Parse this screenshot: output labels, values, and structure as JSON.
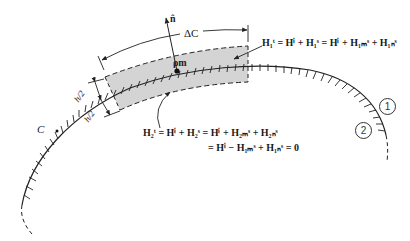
{
  "labels": {
    "normal": "n̂",
    "arc_length": "ΔC",
    "point": "ρm",
    "contour": "C",
    "half_h_top": "h/2",
    "half_h_bottom": "h/2",
    "region_1": "1",
    "region_2": "2"
  },
  "equations": {
    "h1_total": "H₁ᵗ = Hⁱ + H₁ˢ = Hⁱ + H₁ₘˢ + H₁ₙˢ",
    "h2_total_line1": "H₂ᵗ = Hⁱ + H₂ˢ = Hⁱ + H₂ₘˢ + H₂ₙˢ",
    "h2_total_line2": "= Hⁱ − H₁ₘˢ + H₁ₙˢ = 0"
  },
  "colors": {
    "strip_fill": "#d4d4d4",
    "line": "#222222"
  }
}
